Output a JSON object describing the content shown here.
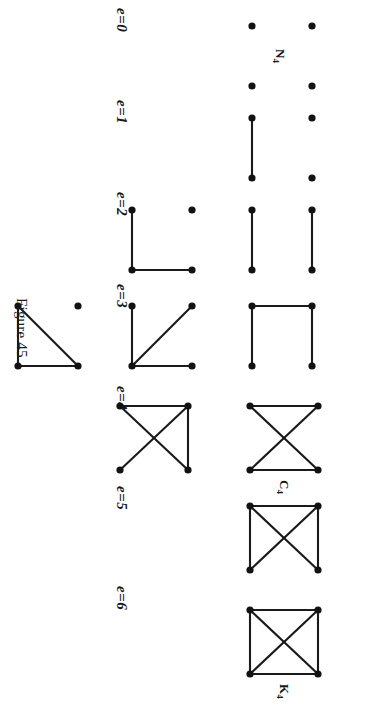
{
  "figure": {
    "caption": "Figure 45",
    "page_background": "#ffffff",
    "ink_color": "#1a1a1c",
    "orientation_degrees": 90,
    "vertex_count": 4
  },
  "columns": [
    {
      "id": "e0",
      "label": "e=0",
      "edge_count": 0,
      "graph_count": 1,
      "graphs": [
        {
          "id": "n4",
          "name": "N",
          "name_sub": "4",
          "name_display": "N4",
          "vertices": [
            [
              0,
              0
            ],
            [
              1,
              0
            ],
            [
              0,
              1
            ],
            [
              1,
              1
            ]
          ],
          "edges": []
        }
      ]
    },
    {
      "id": "e1",
      "label": "e=1",
      "edge_count": 1,
      "graph_count": 1,
      "graphs": [
        {
          "id": "k2-plus-2k1",
          "name": "",
          "name_sub": "",
          "name_display": "",
          "vertices": [
            [
              0,
              0
            ],
            [
              1,
              0
            ],
            [
              0,
              1
            ],
            [
              1,
              1
            ]
          ],
          "edges": [
            [
              0,
              1
            ]
          ]
        }
      ]
    },
    {
      "id": "e2",
      "label": "e=2",
      "edge_count": 2,
      "graph_count": 2,
      "graphs": [
        {
          "id": "2k2",
          "name": "",
          "name_sub": "",
          "name_display": "",
          "vertices": [
            [
              0,
              0
            ],
            [
              1,
              0
            ],
            [
              0,
              1
            ],
            [
              1,
              1
            ]
          ],
          "edges": [
            [
              0,
              1
            ],
            [
              2,
              3
            ]
          ]
        },
        {
          "id": "p3-plus-k1",
          "name": "",
          "name_sub": "",
          "name_display": "",
          "vertices": [
            [
              0,
              0
            ],
            [
              1,
              0
            ],
            [
              0,
              1
            ],
            [
              1,
              1
            ]
          ],
          "edges": [
            [
              0,
              1
            ],
            [
              1,
              3
            ]
          ]
        }
      ]
    },
    {
      "id": "e3",
      "label": "e=3",
      "edge_count": 3,
      "graph_count": 3,
      "graphs": [
        {
          "id": "p4",
          "name": "",
          "name_sub": "",
          "name_display": "",
          "vertices": [
            [
              0,
              0
            ],
            [
              1,
              0
            ],
            [
              0,
              1
            ],
            [
              1,
              1
            ]
          ],
          "edges": [
            [
              0,
              1
            ],
            [
              0,
              2
            ],
            [
              2,
              3
            ]
          ]
        },
        {
          "id": "k13-star",
          "name": "",
          "name_sub": "",
          "name_display": "",
          "vertices": [
            [
              0,
              0
            ],
            [
              1,
              0
            ],
            [
              0,
              1
            ],
            [
              1,
              1
            ]
          ],
          "edges": [
            [
              0,
              1
            ],
            [
              1,
              3
            ],
            [
              1,
              2
            ]
          ]
        },
        {
          "id": "k3-plus-k1",
          "name": "",
          "name_sub": "",
          "name_display": "",
          "vertices": [
            [
              0,
              0
            ],
            [
              1,
              0
            ],
            [
              1,
              1
            ]
          ],
          "edges": [
            [
              0,
              1
            ],
            [
              1,
              2
            ],
            [
              2,
              0
            ]
          ],
          "isolated": [
            [
              0,
              1
            ]
          ]
        }
      ]
    },
    {
      "id": "e4",
      "label": "e=4",
      "edge_count": 4,
      "graph_count": 2,
      "graphs": [
        {
          "id": "c4",
          "name": "C",
          "name_sub": "4",
          "name_display": "C4",
          "vertices": [
            [
              0,
              0
            ],
            [
              1,
              0
            ],
            [
              0,
              1
            ],
            [
              1,
              1
            ]
          ],
          "edges": [
            [
              0,
              1
            ],
            [
              2,
              3
            ],
            [
              0,
              3
            ],
            [
              1,
              2
            ]
          ]
        },
        {
          "id": "paw",
          "name": "",
          "name_sub": "",
          "name_display": "",
          "vertices": [
            [
              0,
              0
            ],
            [
              1,
              0
            ],
            [
              0,
              1
            ],
            [
              1,
              1
            ]
          ],
          "edges": [
            [
              0,
              1
            ],
            [
              0,
              2
            ],
            [
              0,
              3
            ],
            [
              1,
              2
            ]
          ]
        }
      ]
    },
    {
      "id": "e5",
      "label": "e=5",
      "edge_count": 5,
      "graph_count": 1,
      "graphs": [
        {
          "id": "diamond",
          "name": "",
          "name_sub": "",
          "name_display": "",
          "vertices": [
            [
              0,
              0
            ],
            [
              1,
              0
            ],
            [
              0,
              1
            ],
            [
              1,
              1
            ]
          ],
          "edges": [
            [
              0,
              1
            ],
            [
              0,
              2
            ],
            [
              1,
              3
            ],
            [
              0,
              3
            ],
            [
              1,
              2
            ]
          ]
        }
      ]
    },
    {
      "id": "e6",
      "label": "e=6",
      "edge_count": 6,
      "graph_count": 1,
      "graphs": [
        {
          "id": "k4",
          "name": "K",
          "name_sub": "4",
          "name_display": "K4",
          "vertices": [
            [
              0,
              0
            ],
            [
              1,
              0
            ],
            [
              0,
              1
            ],
            [
              1,
              1
            ]
          ],
          "edges": [
            [
              0,
              1
            ],
            [
              2,
              3
            ],
            [
              0,
              2
            ],
            [
              1,
              3
            ],
            [
              0,
              3
            ],
            [
              1,
              2
            ]
          ]
        }
      ]
    }
  ]
}
